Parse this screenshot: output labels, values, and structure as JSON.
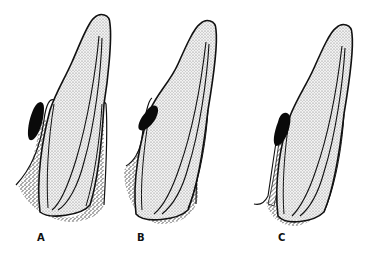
{
  "figure": {
    "panels": [
      {
        "id": "A",
        "label": "A"
      },
      {
        "id": "B",
        "label": "B"
      },
      {
        "id": "C",
        "label": "C"
      }
    ],
    "colors": {
      "outline": "#111111",
      "tooth_fill": "#e6e6e6",
      "bone_stipple": "#555555",
      "lesion": "#0a0a0a",
      "background": "#ffffff"
    }
  }
}
